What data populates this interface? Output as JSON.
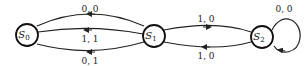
{
  "diagram": {
    "type": "state-machine",
    "states": [
      {
        "id": "S0",
        "label": "S",
        "sub": "0"
      },
      {
        "id": "S1",
        "label": "S",
        "sub": "1"
      },
      {
        "id": "S2",
        "label": "S",
        "sub": "2"
      }
    ],
    "transitions": [
      {
        "from": "S1",
        "to": "S0",
        "label": "0, 0"
      },
      {
        "from": "S1",
        "to": "S0",
        "label": "1, 1"
      },
      {
        "from": "S1",
        "to": "S0",
        "label": "0, 1"
      },
      {
        "from": "S1",
        "to": "S2",
        "label": "1, 0"
      },
      {
        "from": "S2",
        "to": "S1",
        "label": "1, 0"
      },
      {
        "from": "S2",
        "to": "S2",
        "label": "0, 0"
      }
    ],
    "colors": {
      "stroke": "#222222",
      "background": "#ffffff"
    }
  }
}
